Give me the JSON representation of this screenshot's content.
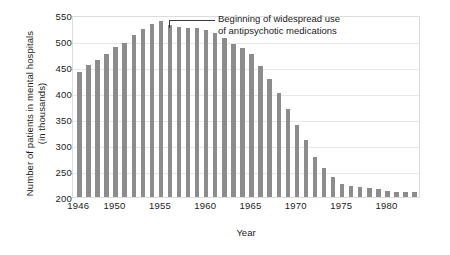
{
  "chart_data": {
    "type": "bar",
    "title": "",
    "xlabel": "Year",
    "ylabel_line1": "Number of patients in mental hospitals",
    "ylabel_line2": "(in thousands)",
    "ylim": [
      200,
      550
    ],
    "yticks": [
      200,
      250,
      300,
      350,
      400,
      450,
      500,
      550
    ],
    "xticks": [
      1946,
      1950,
      1955,
      1960,
      1965,
      1970,
      1975,
      1980
    ],
    "xlim": [
      1945.3,
      1983.7
    ],
    "grid": true,
    "legend": "none",
    "bar_color": "#8c8c8c",
    "categories": [
      1946,
      1947,
      1948,
      1949,
      1950,
      1951,
      1952,
      1953,
      1954,
      1955,
      1956,
      1957,
      1958,
      1959,
      1960,
      1961,
      1962,
      1963,
      1964,
      1965,
      1966,
      1967,
      1968,
      1969,
      1970,
      1971,
      1972,
      1973,
      1974,
      1975,
      1976,
      1977,
      1978,
      1979,
      1980,
      1981,
      1982,
      1983
    ],
    "values": [
      441,
      453,
      464,
      475,
      489,
      496,
      511,
      523,
      533,
      538,
      530,
      526,
      525,
      525,
      522,
      516,
      506,
      495,
      486,
      475,
      452,
      426,
      400,
      369,
      339,
      309,
      276,
      255,
      238,
      225,
      222,
      220,
      218,
      215,
      212,
      210,
      209,
      209
    ],
    "annotations": [
      {
        "text_line1": "Beginning of widespread use",
        "text_line2": "of antipsychotic medications",
        "points_to_year": 1956,
        "points_to_value": 530
      }
    ]
  }
}
